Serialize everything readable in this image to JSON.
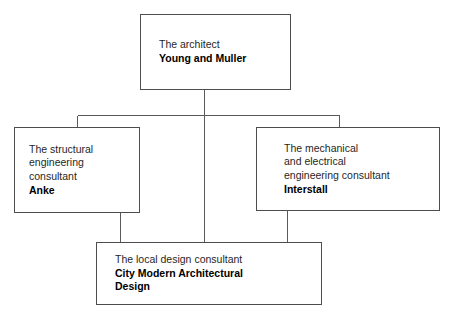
{
  "diagram": {
    "type": "organizational-hierarchy",
    "background_color": "#ffffff",
    "line_color": "#5a5a5a",
    "box_border_color": "#4d4d4d",
    "text_color": "#1a1a1a",
    "nodes": {
      "architect": {
        "role": "The architect",
        "name": "Young and Muller"
      },
      "structural": {
        "role": "The structural\nengineering\nconsultant",
        "name": "Anke"
      },
      "mechanical": {
        "role": "The mechanical\nand electrical\nengineering consultant",
        "name": "Interstall"
      },
      "local": {
        "role": "The local design consultant",
        "name": "City Modern Architectural\nDesign"
      }
    }
  }
}
